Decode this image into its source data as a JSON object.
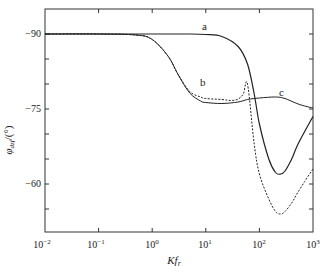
{
  "chart_data": {
    "type": "line",
    "title": "",
    "xlabel": "Kf_r",
    "ylabel": "φ_dzf/(°)",
    "xscale": "log",
    "xlim": [
      0.01,
      1000
    ],
    "ylim": [
      -95,
      -50
    ],
    "y_inverted": true,
    "grid": false,
    "legend": "inline labels",
    "x_ticks": [
      "10^-2",
      "10^-1",
      "10^0",
      "10^1",
      "10^2",
      "10^3"
    ],
    "y_ticks": [
      -90,
      -75,
      -60
    ],
    "series": [
      {
        "name": "a",
        "style": "solid",
        "x": [
          0.01,
          0.1,
          1,
          5,
          10,
          20,
          40,
          60,
          80,
          100,
          150,
          200,
          250,
          300,
          400,
          500,
          700,
          1000
        ],
        "y": [
          -90,
          -90,
          -90,
          -90,
          -89.9,
          -89.5,
          -87.5,
          -84,
          -78,
          -72,
          -65,
          -62.3,
          -62.0,
          -62.6,
          -65,
          -67.5,
          -70.5,
          -73.5
        ]
      },
      {
        "name": "b",
        "style": "dashed",
        "x": [
          0.01,
          0.1,
          0.5,
          1,
          2,
          3,
          5,
          8,
          10,
          20,
          30,
          40,
          50,
          60,
          80,
          100,
          150,
          200,
          250,
          300,
          400,
          500,
          700,
          1000
        ],
        "y": [
          -90,
          -90,
          -89.8,
          -88.9,
          -85.5,
          -82,
          -78.5,
          -77.4,
          -77.1,
          -76.9,
          -76.7,
          -77,
          -78,
          -80,
          -68,
          -62,
          -57,
          -54.5,
          -54,
          -54.5,
          -56.2,
          -58,
          -60.5,
          -63
        ]
      },
      {
        "name": "c",
        "style": "solid",
        "x": [
          0.01,
          0.1,
          0.5,
          1,
          2,
          3,
          5,
          8,
          10,
          20,
          40,
          60,
          100,
          200,
          300,
          500,
          700,
          1000
        ],
        "y": [
          -90,
          -90,
          -89.8,
          -88.9,
          -85.5,
          -82,
          -78.2,
          -76.6,
          -76.3,
          -76.1,
          -76.4,
          -76.9,
          -77.2,
          -77.4,
          -77.1,
          -76.1,
          -75.6,
          -75.2
        ]
      }
    ],
    "annotations": [
      {
        "text": "a",
        "x": 20,
        "y": -90.6
      },
      {
        "text": "b",
        "x": 7,
        "y": -78.6
      },
      {
        "text": "c",
        "x": 300,
        "y": -78.3
      }
    ]
  },
  "labels": {
    "x_ticks": [
      "10",
      "10",
      "10",
      "10",
      "10",
      "10"
    ],
    "x_exp": [
      "−2",
      "−1",
      "0",
      "1",
      "2",
      "3"
    ],
    "y_ticks": [
      "−90",
      "−75",
      "−60"
    ],
    "xlabel_main": "Kf",
    "xlabel_sub": "r",
    "ylabel_main": "φ",
    "ylabel_sub": "dzf",
    "ylabel_unit": "/(°)",
    "curve_a": "a",
    "curve_b": "b",
    "curve_c": "c"
  }
}
